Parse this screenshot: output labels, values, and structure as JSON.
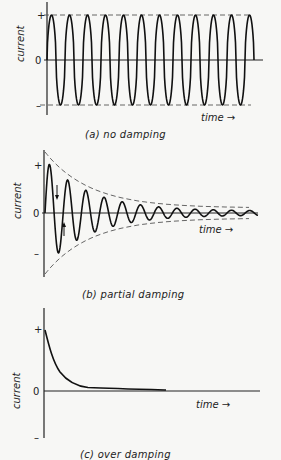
{
  "panels": [
    {
      "id": "a",
      "caption": "(a)  no damping",
      "y_label": "current",
      "x_label": "time →",
      "ticks": {
        "plus": "+",
        "zero": "0",
        "minus": "–"
      }
    },
    {
      "id": "b",
      "caption": "(b)   partial damping",
      "y_label": "current",
      "x_label": "time →",
      "ticks": {
        "plus": "+",
        "zero": "0",
        "minus": "–"
      }
    },
    {
      "id": "c",
      "caption": "(c)   over damping",
      "y_label": "current",
      "x_label": "time →",
      "ticks": {
        "plus": "+",
        "zero": "0",
        "minus": "–"
      }
    }
  ],
  "chart_data": [
    {
      "type": "line",
      "title": "(a) no damping",
      "xlabel": "time",
      "ylabel": "current",
      "description": "Constant-amplitude oscillation, 12 cycles, amplitude bounded by dashed + and - lines",
      "cycles": 12,
      "amplitude": 1.0,
      "y_ticks": [
        "+",
        "0",
        "-"
      ]
    },
    {
      "type": "line",
      "title": "(b) partial damping",
      "xlabel": "time",
      "ylabel": "current",
      "description": "Oscillation with exponentially decaying amplitude inside dashed envelope; arrows indicate current reversal",
      "cycles": 12,
      "peak_amplitudes": [
        1.0,
        0.65,
        0.45,
        0.33,
        0.25,
        0.19,
        0.15,
        0.12,
        0.1,
        0.08,
        0.06,
        0.05
      ],
      "y_ticks": [
        "+",
        "0",
        "-"
      ]
    },
    {
      "type": "line",
      "title": "(c) over damping",
      "xlabel": "time",
      "ylabel": "current",
      "description": "Current starts at + and decays monotonically toward zero without oscillation",
      "x": [
        0,
        0.07,
        0.18,
        0.35,
        0.6,
        1.0
      ],
      "values": [
        1.0,
        0.5,
        0.21,
        0.08,
        0.04,
        0.02
      ],
      "y_ticks": [
        "+",
        "0",
        "-"
      ]
    }
  ]
}
